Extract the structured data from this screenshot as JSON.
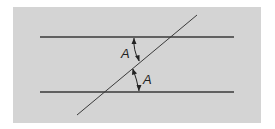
{
  "figure": {
    "background": "#d4d4d4",
    "line_color": "#3a3a3a",
    "angle_labels": [
      "A",
      "A"
    ]
  }
}
